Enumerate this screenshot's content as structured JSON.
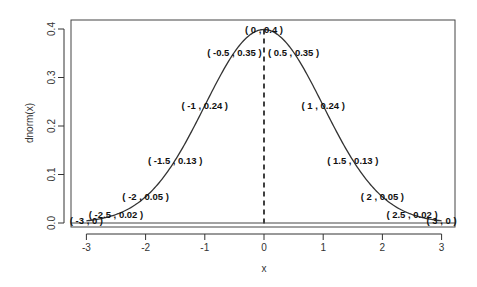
{
  "chart_data": {
    "type": "line",
    "title": "",
    "xlabel": "x",
    "ylabel": "dnorm(x)",
    "xlim": [
      -3.25,
      3.25
    ],
    "ylim": [
      -0.008,
      0.41
    ],
    "grid": false,
    "legend": null,
    "x_ticks": [
      -3,
      -2,
      -1,
      0,
      1,
      2,
      3
    ],
    "x_tick_labels": [
      "-3",
      "-2",
      "-1",
      "0",
      "1",
      "2",
      "3"
    ],
    "y_ticks": [
      0.0,
      0.1,
      0.2,
      0.3,
      0.4
    ],
    "y_tick_labels": [
      "0.0",
      "0.1",
      "0.2",
      "0.3",
      "0.4"
    ],
    "series": [
      {
        "name": "dnorm(x)",
        "x": [
          -3,
          -2.5,
          -2,
          -1.5,
          -1,
          -0.5,
          0,
          0.5,
          1,
          1.5,
          2,
          2.5,
          3
        ],
        "values": [
          0.0044,
          0.0175,
          0.054,
          0.1295,
          0.242,
          0.3521,
          0.3989,
          0.3521,
          0.242,
          0.1295,
          0.054,
          0.0175,
          0.0044
        ]
      }
    ],
    "annotations": [
      {
        "x": -3,
        "y": 0,
        "text": "( -3 , 0 )"
      },
      {
        "x": -2.5,
        "y": 0.02,
        "text": "( -2.5 , 0.02 )"
      },
      {
        "x": -2,
        "y": 0.05,
        "text": "( -2 , 0.05 )"
      },
      {
        "x": -1.5,
        "y": 0.13,
        "text": "( -1.5 , 0.13 )"
      },
      {
        "x": -1,
        "y": 0.24,
        "text": "( -1 , 0.24 )"
      },
      {
        "x": -0.5,
        "y": 0.35,
        "text": "( -0.5 , 0.35 )"
      },
      {
        "x": 0,
        "y": 0.4,
        "text": "( 0 , 0.4 )"
      },
      {
        "x": 0.5,
        "y": 0.35,
        "text": "( 0.5 , 0.35 )"
      },
      {
        "x": 1,
        "y": 0.24,
        "text": "( 1 , 0.24 )"
      },
      {
        "x": 1.5,
        "y": 0.13,
        "text": "( 1.5 , 0.13 )"
      },
      {
        "x": 2,
        "y": 0.05,
        "text": "( 2 , 0.05 )"
      },
      {
        "x": 2.5,
        "y": 0.02,
        "text": "( 2.5 , 0.02 )"
      },
      {
        "x": 3,
        "y": 0,
        "text": "( 3 , 0 )"
      }
    ],
    "reference_lines": [
      {
        "type": "vertical",
        "x": 0,
        "style": "dashed"
      },
      {
        "type": "horizontal",
        "y": 0,
        "style": "solid"
      }
    ]
  },
  "colors": {
    "line": "#333333",
    "axis": "#333333",
    "text": "#111111"
  }
}
